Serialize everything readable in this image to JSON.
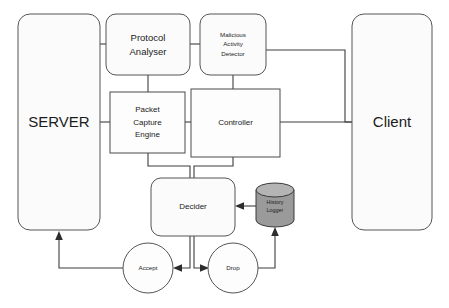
{
  "diagram": {
    "colors": {
      "node_fill": "#fbfbfb",
      "node_stroke": "#555555",
      "cylinder_fill": "#9a9a9a",
      "cylinder_top": "#b4b4b4",
      "edge_stroke": "#3d3d3d",
      "text": "#1b1b1b",
      "background": "#ffffff"
    },
    "nodes": [
      {
        "id": "server",
        "label": "SERVER",
        "shape": "rounded-rectangle",
        "x": 18,
        "y": 14,
        "width": 82,
        "height": 216,
        "label_size": "xl"
      },
      {
        "id": "protocol-analyser",
        "label_lines": [
          "Protocol",
          "Analyser"
        ],
        "shape": "rounded-rectangle",
        "x": 106,
        "y": 14,
        "width": 84,
        "height": 61,
        "label_size": "md"
      },
      {
        "id": "malicious-activity-detector",
        "label_lines": [
          "Malicious",
          "Activity",
          "Detector"
        ],
        "shape": "rounded-rectangle",
        "x": 200,
        "y": 14,
        "width": 66,
        "height": 61,
        "label_size": "xs"
      },
      {
        "id": "packet-capture-engine",
        "label_lines": [
          "Packet",
          "Capture",
          "Engine"
        ],
        "shape": "rectangle",
        "x": 110,
        "y": 92,
        "width": 75,
        "height": 61,
        "label_size": "sm"
      },
      {
        "id": "controller",
        "label": "Controller",
        "shape": "rectangle",
        "x": 191,
        "y": 89,
        "width": 89,
        "height": 68,
        "label_size": "sm"
      },
      {
        "id": "client",
        "label": "Client",
        "shape": "rounded-rectangle",
        "x": 352,
        "y": 14,
        "width": 80,
        "height": 216,
        "label_size": "xl"
      },
      {
        "id": "decider",
        "label": "Decider",
        "shape": "rounded-rectangle",
        "x": 151,
        "y": 178,
        "width": 84,
        "height": 58,
        "label_size": "sm"
      },
      {
        "id": "history-logger",
        "label_lines": [
          "History",
          "Logger"
        ],
        "shape": "cylinder",
        "x": 256,
        "y": 183,
        "width": 38,
        "height": 44,
        "label_size": "cyl"
      },
      {
        "id": "accept",
        "label": "Accept",
        "shape": "circle",
        "cx": 148,
        "cy": 268,
        "r": 25,
        "label_size": "xs"
      },
      {
        "id": "drop",
        "label": "Drop",
        "shape": "circle",
        "cx": 233,
        "cy": 268,
        "r": 25,
        "label_size": "xs"
      }
    ],
    "edges": [
      {
        "id": "server-to-protocol-analyser",
        "from": "server",
        "to": "protocol-analyser",
        "arrow": false
      },
      {
        "id": "protocol-analyser-to-malicious-activity-detector",
        "from": "protocol-analyser",
        "to": "malicious-activity-detector",
        "arrow": false
      },
      {
        "id": "protocol-analyser-to-packet-capture-engine",
        "from": "protocol-analyser",
        "to": "packet-capture-engine",
        "arrow": false
      },
      {
        "id": "server-to-packet-capture-engine",
        "from": "server",
        "to": "packet-capture-engine",
        "arrow": false
      },
      {
        "id": "packet-capture-engine-to-controller",
        "from": "packet-capture-engine",
        "to": "controller",
        "arrow": false
      },
      {
        "id": "malicious-activity-detector-to-controller",
        "from": "malicious-activity-detector",
        "to": "controller",
        "arrow": false
      },
      {
        "id": "malicious-activity-detector-to-client",
        "from": "malicious-activity-detector",
        "to": "client",
        "arrow": false
      },
      {
        "id": "controller-to-client",
        "from": "controller",
        "to": "client",
        "arrow": false
      },
      {
        "id": "packet-capture-engine-to-decider",
        "from": "packet-capture-engine",
        "to": "decider",
        "arrow": false
      },
      {
        "id": "controller-to-decider",
        "from": "controller",
        "to": "decider",
        "arrow": false
      },
      {
        "id": "history-logger-to-decider",
        "from": "history-logger",
        "to": "decider",
        "arrow": true
      },
      {
        "id": "decider-to-accept",
        "from": "decider",
        "to": "accept",
        "arrow": true
      },
      {
        "id": "decider-to-drop",
        "from": "decider",
        "to": "drop",
        "arrow": true
      },
      {
        "id": "drop-to-history-logger",
        "from": "drop",
        "to": "history-logger",
        "arrow": true
      },
      {
        "id": "accept-to-server",
        "from": "accept",
        "to": "server",
        "arrow": true
      }
    ]
  }
}
